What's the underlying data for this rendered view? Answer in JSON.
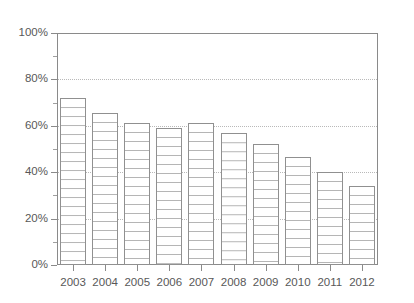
{
  "chart_data": {
    "type": "bar",
    "title": "",
    "xlabel": "",
    "ylabel": "",
    "categories": [
      "2003",
      "2004",
      "2005",
      "2006",
      "2007",
      "2008",
      "2009",
      "2010",
      "2011",
      "2012"
    ],
    "values": [
      72,
      65.5,
      61,
      59,
      61,
      57,
      52,
      46.5,
      40,
      34
    ],
    "ylim": [
      0,
      100
    ],
    "ytick_labels": [
      "0%",
      "20%",
      "40%",
      "60%",
      "80%",
      "100%"
    ],
    "ytick_values": [
      0,
      20,
      40,
      60,
      80,
      100
    ],
    "yminor_tick_values": [
      10,
      30,
      50,
      70,
      90
    ],
    "gridline_values": [
      20,
      40,
      60,
      80
    ],
    "grid": true,
    "legend": "none",
    "unit": "%",
    "bar_fill": "#ffffff",
    "bar_hatch": "horizontal-lines",
    "bar_edge_color": "#909090",
    "grid_color": "#b9b9b9",
    "axis_color": "#8a8a8a",
    "background": "#ffffff",
    "series": [
      {
        "name": "",
        "values": [
          72,
          65.5,
          61,
          59,
          61,
          57,
          52,
          46.5,
          40,
          34
        ]
      }
    ],
    "points": [
      {
        "category": "2003",
        "value": 72
      },
      {
        "category": "2004",
        "value": 65.5
      },
      {
        "category": "2005",
        "value": 61
      },
      {
        "category": "2006",
        "value": 59
      },
      {
        "category": "2007",
        "value": 61
      },
      {
        "category": "2008",
        "value": 57
      },
      {
        "category": "2009",
        "value": 52
      },
      {
        "category": "2010",
        "value": 46.5
      },
      {
        "category": "2011",
        "value": 40
      },
      {
        "category": "2012",
        "value": 34
      }
    ]
  }
}
